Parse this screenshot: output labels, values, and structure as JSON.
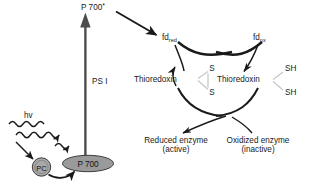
{
  "figure": {
    "name": "photosystem-i-ferredoxin-thioredoxin-regulation-diagram",
    "background_color": "#ffffff",
    "width": 315,
    "height": 183
  },
  "colors": {
    "stroke": "#1a1a1a",
    "text": "#1a1a1a",
    "p700_fill": "#9a9a9a",
    "p700_stroke": "#3d3d3d",
    "pc_fill": "#a8a8a8",
    "pc_stroke": "#3d3d3d",
    "thick_arrow_fill": "#4d4d4d",
    "sulfur_link": "#c8c8c8"
  },
  "labels": {
    "p700_excited": "P 700",
    "p700_excited_sup": "*",
    "ps1": "PS I",
    "p700": "P 700",
    "pc": "PC",
    "hv": "hv",
    "fd_red_base": "fd",
    "fd_red_sub": "red",
    "fd_ox_base": "fd",
    "fd_ox_sub": "ox",
    "thioredoxin_left": "Thioredoxin",
    "thioredoxin_right": "Thioredoxin",
    "sulfur_top": "S",
    "sulfur_bottom": "S",
    "thiol_top": "SH",
    "thiol_bottom": "SH",
    "reduced_enzyme": "Reduced enzyme",
    "reduced_enzyme_state": "(active)",
    "oxidized_enzyme": "Oxidized enzyme",
    "oxidized_enzyme_state": "(inactive)"
  }
}
